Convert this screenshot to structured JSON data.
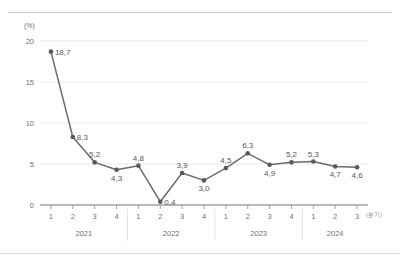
{
  "chart_data": {
    "type": "line",
    "title": "",
    "subtitle": "",
    "xlabel": "(분기)",
    "ylabel": "(%)",
    "ylim": [
      0,
      20
    ],
    "yticks": [
      0,
      5,
      10,
      15,
      20
    ],
    "ytick_labels": [
      "0",
      "5",
      "10",
      "15",
      "20"
    ],
    "grid": true,
    "grid_axis": "y",
    "legend": false,
    "legend_position": "none",
    "categories": [
      "1",
      "2",
      "3",
      "4",
      "1",
      "2",
      "3",
      "4",
      "1",
      "2",
      "3",
      "4",
      "1",
      "2",
      "3"
    ],
    "values": [
      18.7,
      8.3,
      5.2,
      4.3,
      4.8,
      0.4,
      3.9,
      3.0,
      4.5,
      6.3,
      4.9,
      5.2,
      5.3,
      4.7,
      4.6
    ],
    "point_labels": [
      "18,7",
      "8,3",
      "5,2",
      "4,3",
      "4,8",
      "0,4",
      "3,9",
      "3,0",
      "4,5",
      "6,3",
      "4,9",
      "5,2",
      "5,3",
      "4,7",
      "4,6"
    ],
    "label_positions": [
      "right",
      "right",
      "above",
      "below",
      "above",
      "right",
      "above",
      "below",
      "above",
      "above",
      "below",
      "above",
      "above",
      "below",
      "below"
    ],
    "year_groups": [
      {
        "label": "2021",
        "start_index": 0,
        "end_index": 3
      },
      {
        "label": "2022",
        "start_index": 4,
        "end_index": 7
      },
      {
        "label": "2023",
        "start_index": 8,
        "end_index": 11
      },
      {
        "label": "2024",
        "start_index": 12,
        "end_index": 14
      }
    ],
    "series_color": "#6b6b6b",
    "marker_color": "#5a5a5a",
    "grid_color": "#e6e6e6",
    "axis_color": "#9a9a9a",
    "text_color": "#6f6f6f"
  }
}
